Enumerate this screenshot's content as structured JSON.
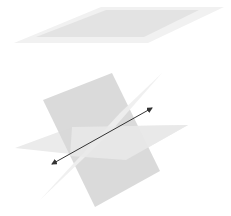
{
  "diagram": {
    "colors": {
      "background": "#ffffff",
      "plane_outer": "#f0f0f0",
      "plane_inner": "#e2e2e2",
      "plane_dark": "#d6d6d6",
      "plane_light": "#ececec",
      "plane_horizontal": "#e6e6e6",
      "line": "#333333"
    },
    "top_plane": {
      "outer": "14,43 101,7 224,7 148,43",
      "inner": "36,37 106,10 199,10 144,37"
    },
    "intersecting_planes": {
      "dark_plane": "43,100 112,73 160,171 95,207",
      "light_plane": "162,73 120,113 40,200 106,137",
      "horizontal_plane": "15,148 72,127 188,125 126,160"
    },
    "intersection_line": {
      "x1": 52,
      "y1": 164,
      "x2": 152,
      "y2": 108
    }
  }
}
